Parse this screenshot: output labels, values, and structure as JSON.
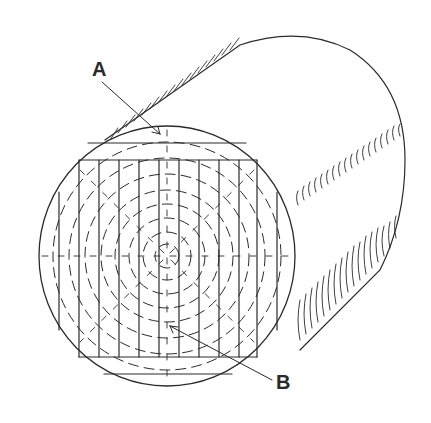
{
  "figure": {
    "labels": [
      {
        "id": "A",
        "text": "A",
        "points_to": "outer portion of the log near the bark"
      },
      {
        "id": "B",
        "text": "B",
        "points_to": "center (pith) region of the log"
      }
    ],
    "boards_count": 10,
    "colors": {
      "line": "#2a2a2a",
      "background": "#ffffff"
    }
  }
}
